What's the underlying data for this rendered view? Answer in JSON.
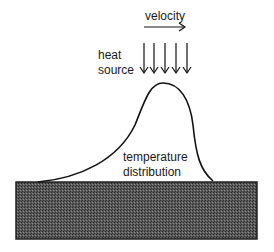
{
  "labels": {
    "velocity": "velocity",
    "heat_source_line1": "heat",
    "heat_source_line2": "source",
    "temperature_line1": "temperature",
    "temperature_line2": "distribution"
  },
  "diagram": {
    "heat_source_arrow_count": 5,
    "colors": {
      "stroke": "#111111",
      "substrate_fill": "#4a4a4a",
      "background": "#ffffff"
    }
  }
}
